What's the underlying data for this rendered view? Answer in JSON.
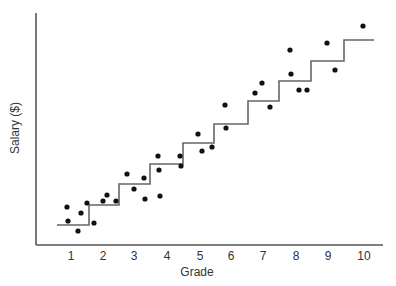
{
  "chart_data": {
    "type": "scatter",
    "title": "",
    "xlabel": "Grade",
    "ylabel": "Salary ($)",
    "x_ticks": [
      "1",
      "2",
      "3",
      "4",
      "5",
      "6",
      "7",
      "8",
      "9",
      "10"
    ],
    "xlim": [
      0,
      10.5
    ],
    "ylim": [
      0,
      100
    ],
    "y_ticks": [],
    "grid": false,
    "legend": null,
    "note": "Salary axis unlabeled; y values are relative units (0 = axis, 100 = top of axis).",
    "series": [
      {
        "name": "Employees",
        "type": "scatter",
        "points": [
          {
            "grade": 0.9,
            "salary": 16.4
          },
          {
            "grade": 0.9,
            "salary": 10.3
          },
          {
            "grade": 1.2,
            "salary": 6.0
          },
          {
            "grade": 1.3,
            "salary": 13.8
          },
          {
            "grade": 1.5,
            "salary": 18.1
          },
          {
            "grade": 1.7,
            "salary": 9.5
          },
          {
            "grade": 2.0,
            "salary": 19.0
          },
          {
            "grade": 2.1,
            "salary": 21.6
          },
          {
            "grade": 2.4,
            "salary": 19.0
          },
          {
            "grade": 2.7,
            "salary": 30.6
          },
          {
            "grade": 3.0,
            "salary": 24.1
          },
          {
            "grade": 3.3,
            "salary": 28.9
          },
          {
            "grade": 3.3,
            "salary": 19.8
          },
          {
            "grade": 3.7,
            "salary": 38.4
          },
          {
            "grade": 3.7,
            "salary": 32.3
          },
          {
            "grade": 3.8,
            "salary": 21.1
          },
          {
            "grade": 4.4,
            "salary": 38.4
          },
          {
            "grade": 4.4,
            "salary": 34.1
          },
          {
            "grade": 4.9,
            "salary": 47.8
          },
          {
            "grade": 5.0,
            "salary": 40.5
          },
          {
            "grade": 5.3,
            "salary": 42.2
          },
          {
            "grade": 5.8,
            "salary": 50.4
          },
          {
            "grade": 5.8,
            "salary": 60.3
          },
          {
            "grade": 6.7,
            "salary": 65.5
          },
          {
            "grade": 6.9,
            "salary": 69.8
          },
          {
            "grade": 7.2,
            "salary": 59.5
          },
          {
            "grade": 7.8,
            "salary": 83.6
          },
          {
            "grade": 7.8,
            "salary": 73.7
          },
          {
            "grade": 8.0,
            "salary": 67.2
          },
          {
            "grade": 8.3,
            "salary": 67.2
          },
          {
            "grade": 8.9,
            "salary": 87.1
          },
          {
            "grade": 9.1,
            "salary": 75.4
          },
          {
            "grade": 9.9,
            "salary": 94.4
          }
        ]
      },
      {
        "name": "Salary schedule (step)",
        "type": "step",
        "steps": [
          {
            "grade_from": 0.5,
            "grade_to": 1.5,
            "salary": 8.6
          },
          {
            "grade_from": 1.5,
            "grade_to": 2.5,
            "salary": 17.2
          },
          {
            "grade_from": 2.5,
            "grade_to": 3.5,
            "salary": 26.3
          },
          {
            "grade_from": 3.5,
            "grade_to": 4.5,
            "salary": 34.9
          },
          {
            "grade_from": 4.5,
            "grade_to": 5.5,
            "salary": 43.9
          },
          {
            "grade_from": 5.5,
            "grade_to": 6.5,
            "salary": 52.2
          },
          {
            "grade_from": 6.5,
            "grade_to": 7.5,
            "salary": 62.1
          },
          {
            "grade_from": 7.5,
            "grade_to": 8.5,
            "salary": 70.7
          },
          {
            "grade_from": 8.5,
            "grade_to": 9.5,
            "salary": 79.3
          },
          {
            "grade_from": 9.5,
            "grade_to": 10.4,
            "salary": 88.4
          }
        ]
      }
    ]
  },
  "render": {
    "x_tick_px": [
      71,
      103,
      134,
      167,
      200,
      231,
      263,
      296,
      328,
      364
    ],
    "dots_px": [
      [
        67,
        207
      ],
      [
        68,
        221
      ],
      [
        78,
        231
      ],
      [
        81,
        213
      ],
      [
        87,
        203
      ],
      [
        94,
        223
      ],
      [
        103,
        201
      ],
      [
        107,
        195
      ],
      [
        116,
        201
      ],
      [
        127,
        174
      ],
      [
        134,
        189
      ],
      [
        144,
        178
      ],
      [
        145,
        199
      ],
      [
        158,
        156
      ],
      [
        159,
        170
      ],
      [
        160,
        196
      ],
      [
        180,
        156
      ],
      [
        181,
        166
      ],
      [
        198,
        134
      ],
      [
        202,
        151
      ],
      [
        212,
        147
      ],
      [
        226,
        128
      ],
      [
        225,
        105
      ],
      [
        255,
        93
      ],
      [
        262,
        83
      ],
      [
        270,
        107
      ],
      [
        290,
        50
      ],
      [
        291,
        74
      ],
      [
        299,
        90
      ],
      [
        307,
        90
      ],
      [
        327,
        43
      ],
      [
        335,
        70
      ],
      [
        363,
        26
      ]
    ],
    "step_path_px": "M57,225 H89 V205 H119 V184 H150 V164 H183 V143 H214 V124 H248 V101 H279 V81 H311 V61 H344 V40 H374"
  }
}
